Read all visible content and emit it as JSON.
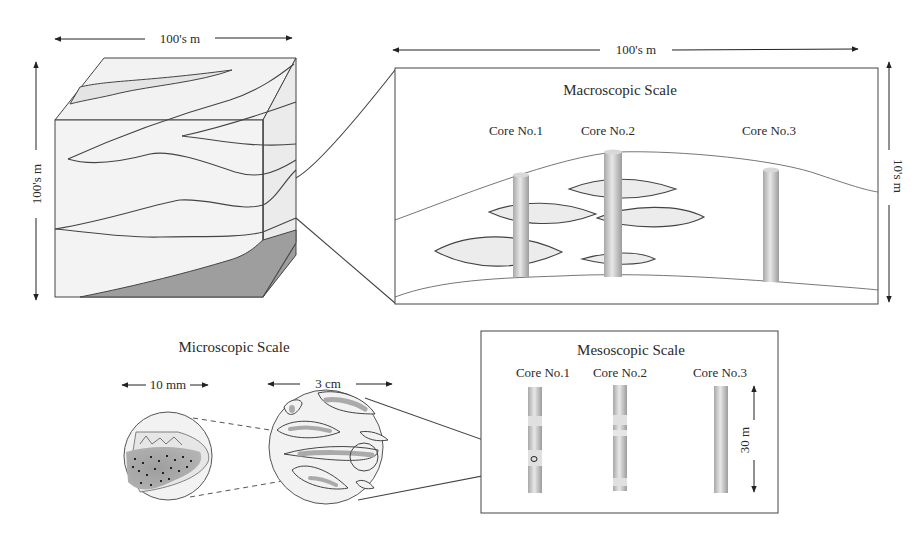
{
  "block_diagram": {
    "width_label": "100's m",
    "height_label": "100's m"
  },
  "macroscopic": {
    "title": "Macroscopic Scale",
    "width_label": "100's m",
    "height_label": "10's m",
    "cores": [
      {
        "label": "Core No.1"
      },
      {
        "label": "Core No.2"
      },
      {
        "label": "Core No.3"
      }
    ]
  },
  "microscopic": {
    "title": "Microscopic Scale",
    "small_circle_label": "10 mm",
    "large_circle_label": "3 cm"
  },
  "mesoscopic": {
    "title": "Mesoscopic Scale",
    "height_label": "30 m",
    "cores": [
      {
        "label": "Core No.1"
      },
      {
        "label": "Core No.2"
      },
      {
        "label": "Core No.3"
      }
    ]
  },
  "colors": {
    "line": "#444444",
    "light_fill": "#f0f0f0",
    "mid_fill": "#e2e2e2",
    "dark_fill": "#9a9a9a",
    "core_fill": "#cfcfcf"
  }
}
